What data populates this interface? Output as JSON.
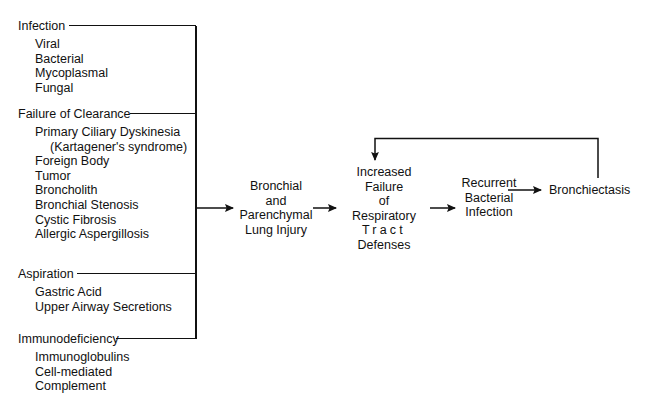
{
  "diagram": {
    "line_color": "#111111",
    "background": "#ffffff",
    "groups": [
      {
        "id": "infection",
        "title": "Infection",
        "items": [
          {
            "label": "Viral",
            "indent": false
          },
          {
            "label": "Bacterial",
            "indent": false
          },
          {
            "label": "Mycoplasmal",
            "indent": false
          },
          {
            "label": "Fungal",
            "indent": false
          }
        ]
      },
      {
        "id": "failure-of-clearance",
        "title": "Failure of Clearance",
        "items": [
          {
            "label": "Primary Ciliary Dyskinesia",
            "indent": false
          },
          {
            "label": "(Kartagener's syndrome)",
            "indent": true
          },
          {
            "label": "Foreign Body",
            "indent": false
          },
          {
            "label": "Tumor",
            "indent": false
          },
          {
            "label": "Broncholith",
            "indent": false
          },
          {
            "label": "Bronchial Stenosis",
            "indent": false
          },
          {
            "label": "Cystic Fibrosis",
            "indent": false
          },
          {
            "label": "Allergic Aspergillosis",
            "indent": false
          }
        ]
      },
      {
        "id": "aspiration",
        "title": "Aspiration",
        "items": [
          {
            "label": "Gastric Acid",
            "indent": false
          },
          {
            "label": "Upper Airway Secretions",
            "indent": false
          }
        ]
      },
      {
        "id": "immunodeficiency",
        "title": "Immunodeficiency",
        "items": [
          {
            "label": "Immunoglobulins",
            "indent": false
          },
          {
            "label": "Cell-mediated",
            "indent": false
          },
          {
            "label": "Complement",
            "indent": false
          }
        ]
      }
    ],
    "nodes": [
      {
        "id": "lung-injury",
        "lines": [
          {
            "text": "Bronchial",
            "spaced": false
          },
          {
            "text": "and",
            "spaced": false
          },
          {
            "text": "Parenchymal",
            "spaced": false
          },
          {
            "text": "Lung Injury",
            "spaced": false
          }
        ]
      },
      {
        "id": "increased-failure",
        "lines": [
          {
            "text": "Increased",
            "spaced": false
          },
          {
            "text": "Failure",
            "spaced": false
          },
          {
            "text": "of",
            "spaced": false
          },
          {
            "text": "Respiratory",
            "spaced": false
          },
          {
            "text": "Tract",
            "spaced": true
          },
          {
            "text": "Defenses",
            "spaced": false
          }
        ]
      },
      {
        "id": "recurrent-infection",
        "lines": [
          {
            "text": "Recurrent",
            "spaced": false
          },
          {
            "text": "Bacterial",
            "spaced": false
          },
          {
            "text": "Infection",
            "spaced": false
          }
        ]
      },
      {
        "id": "bronchiectasis",
        "lines": [
          {
            "text": "Bronchiectasis",
            "spaced": false
          }
        ]
      }
    ]
  }
}
